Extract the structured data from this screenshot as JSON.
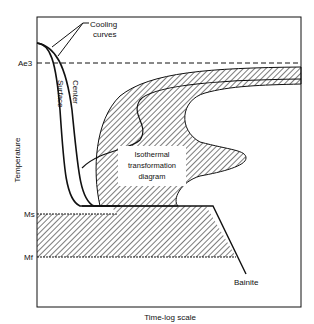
{
  "diagram": {
    "labels": {
      "cooling_curves_line1": "Cooling",
      "cooling_curves_line2": "curves",
      "surface": "Surface",
      "center": "Center",
      "itt_line1": "Isothermal",
      "itt_line2": "transformation",
      "itt_line3": "diagram",
      "bainite": "Bainite"
    },
    "axes": {
      "y_label": "Temperature",
      "x_label": "Time-log scale",
      "y_ticks": [
        "Ae3",
        "Ms",
        "Mf"
      ]
    },
    "colors": {
      "line": "#111111",
      "background": "#ffffff",
      "hatch": "#222222"
    }
  }
}
